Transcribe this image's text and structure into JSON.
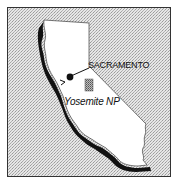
{
  "map": {
    "region": "California",
    "background_pattern": "stippled-gray",
    "colors": {
      "background": "#d8d8d8",
      "land": "#ffffff",
      "coast_shadow": "#111111",
      "border": "#333333",
      "park_fill": "#999999"
    },
    "markers": [
      {
        "type": "city",
        "label": "SACRAMENTO",
        "icon": "city-dot-icon"
      },
      {
        "type": "park",
        "label": "Yosemite NP",
        "icon": "park-square-icon"
      }
    ]
  }
}
